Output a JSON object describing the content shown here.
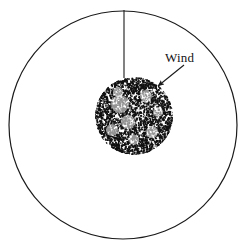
{
  "figure": {
    "background_color": "#ffffff",
    "stroke_color": "#1a1a1a",
    "stipple_color": "#111111",
    "width": 246,
    "height": 251
  },
  "outer_circle": {
    "name": "outer-boundary-circle",
    "center_x": 123,
    "center_y": 125,
    "radius": 114,
    "stroke_width": 1.2,
    "fill": "none"
  },
  "stipple_patch": {
    "name": "stippled-region",
    "center_x": 134,
    "center_y": 116,
    "radius": 39,
    "dot_count": 2600,
    "dot_min_size": 0.8,
    "dot_max_size": 2.0
  },
  "pointer_line": {
    "name": "vertical-reference-line",
    "x": 124,
    "y_start": 10,
    "y_end": 78,
    "stroke_width": 1.1
  },
  "wind_annotation": {
    "label": "Wind",
    "label_x": 165,
    "label_y": 62,
    "arrow_start_x": 184,
    "arrow_start_y": 65,
    "arrow_end_x": 158,
    "arrow_end_y": 86,
    "stroke_width": 1.1
  }
}
